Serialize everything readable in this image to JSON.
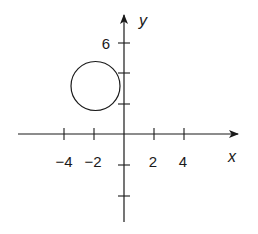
{
  "diagram": {
    "type": "coordinate-plane",
    "x_axis_label": "x",
    "y_axis_label": "y",
    "x_tick_labels": [
      {
        "value": -4,
        "label": "−4"
      },
      {
        "value": -2,
        "label": "−2"
      },
      {
        "value": 2,
        "label": "2"
      },
      {
        "value": 4,
        "label": "4"
      }
    ],
    "y_tick_labels": [
      {
        "value": 6,
        "label": "6"
      }
    ],
    "y_ticks_unlabeled": [
      4,
      2,
      -2,
      -4
    ],
    "circle": {
      "center": [
        -2,
        3
      ],
      "radius": 1.6
    },
    "colors": {
      "stroke": "#1a1a1a",
      "background": "#ffffff"
    }
  }
}
